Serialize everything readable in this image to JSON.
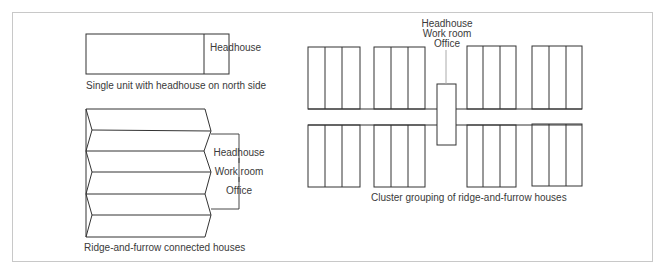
{
  "figures": {
    "single_unit": {
      "headhouse_label": "Headhouse",
      "caption": "Single unit with headhouse on north side"
    },
    "ridge_and_furrow": {
      "bracket_labels": [
        "Headhouse",
        "Work room",
        "Office"
      ],
      "caption": "Ridge-and-furrow connected houses"
    },
    "cluster": {
      "top_labels": [
        "Headhouse",
        "Work room",
        "Office"
      ],
      "caption": "Cluster grouping of ridge-and-furrow houses"
    }
  },
  "colors": {
    "line": "#333333",
    "frame": "#c8c8c8",
    "leader": "#aaaaaa"
  }
}
